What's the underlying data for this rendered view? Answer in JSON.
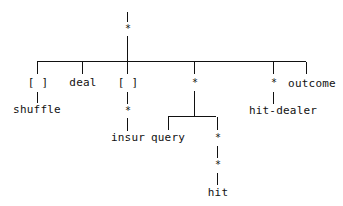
{
  "diagram": {
    "type": "tree",
    "root": {
      "marker": "*",
      "children": [
        {
          "marker": "[ ]",
          "label": "shuffle"
        },
        {
          "label": "deal"
        },
        {
          "marker": "[ ]",
          "sub_marker": "*",
          "label": "insur"
        },
        {
          "marker": "*",
          "children": [
            {
              "label": "query"
            },
            {
              "marker": "*",
              "sub_marker": "*",
              "label": "hit"
            }
          ]
        },
        {
          "marker": "*",
          "label": "hit-dealer"
        },
        {
          "label": "outcome"
        }
      ]
    },
    "labels": {
      "shuffle": "shuffle",
      "deal": "deal",
      "insur": "insur",
      "query": "query",
      "hit": "hit",
      "hit_dealer": "hit-dealer",
      "outcome": "outcome"
    },
    "markers": {
      "star": "*",
      "optional": "[ ]"
    }
  }
}
